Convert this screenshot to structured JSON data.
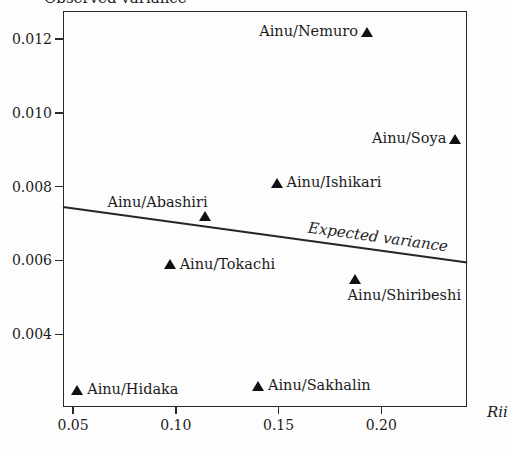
{
  "figure": {
    "ink_color": "#1c1c1c",
    "background_color": "#fdfdfd",
    "marker_glyph": "filled-triangle-up"
  },
  "chart_data": {
    "type": "scatter",
    "title": "Observed variance",
    "ylabel": "Observed variance",
    "xlabel": "Rii",
    "xlim": [
      0.0451,
      0.2417
    ],
    "ylim": [
      0.00203,
      0.01276
    ],
    "grid": false,
    "legend": "none",
    "xticks": {
      "values": [
        0.05,
        0.1,
        0.15,
        0.2
      ],
      "labels": [
        "0.05",
        "0.10",
        "0.15",
        "0.20"
      ]
    },
    "yticks": {
      "values": [
        0.004,
        0.006,
        0.008,
        0.01,
        0.012
      ],
      "labels": [
        "0.004",
        "0.006",
        "0.008",
        "0.010",
        "0.012"
      ]
    },
    "points": [
      {
        "label": "Ainu/Nemuro",
        "x": 0.193,
        "y": 0.0122,
        "label_side": "left"
      },
      {
        "label": "Ainu/Soya",
        "x": 0.236,
        "y": 0.0093,
        "label_side": "left"
      },
      {
        "label": "Ainu/Ishikari",
        "x": 0.149,
        "y": 0.0081,
        "label_side": "right"
      },
      {
        "label": "Ainu/Abashiri",
        "x": 0.114,
        "y": 0.0072,
        "label_side": "above-left"
      },
      {
        "label": "Ainu/Tokachi",
        "x": 0.097,
        "y": 0.0059,
        "label_side": "right"
      },
      {
        "label": "Ainu/Shiribeshi",
        "x": 0.187,
        "y": 0.0055,
        "label_side": "below"
      },
      {
        "label": "Ainu/Hidaka",
        "x": 0.052,
        "y": 0.0025,
        "label_side": "right"
      },
      {
        "label": "Ainu/Sakhalin",
        "x": 0.14,
        "y": 0.0026,
        "label_side": "right"
      }
    ],
    "trend_line": {
      "label": "Expected variance",
      "x1": 0.0451,
      "y1": 0.00745,
      "x2": 0.2417,
      "y2": 0.00595,
      "label_t": 0.78
    }
  }
}
